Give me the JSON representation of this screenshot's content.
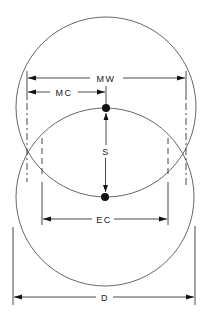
{
  "diagram": {
    "labels": {
      "mw": "MW",
      "mc": "MC",
      "s": "S",
      "ec": "EC",
      "d": "D"
    },
    "elements": {
      "upper_circle": {
        "cx": 106,
        "cy": 107,
        "r": 90
      },
      "lower_circle": {
        "cx": 105,
        "cy": 197,
        "r": 89
      },
      "top_dot": {
        "cx": 106,
        "cy": 108
      },
      "bottom_dot": {
        "cx": 105,
        "cy": 197
      }
    },
    "colors": {
      "line": "#333333",
      "circle": "#555555",
      "fill": "#111111",
      "background": "#ffffff"
    }
  }
}
